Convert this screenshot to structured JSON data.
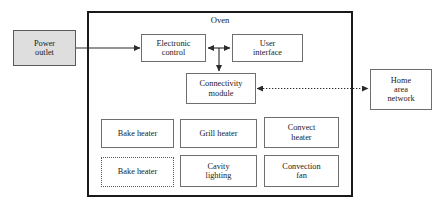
{
  "diagram": {
    "enclosure": {
      "label": "Oven"
    },
    "external_blocks": [
      {
        "id": "power-outlet",
        "label": "Power\noutlet",
        "style": "shaded"
      },
      {
        "id": "home-area-network",
        "label": "Home\narea\nnetwork",
        "style": "solid"
      }
    ],
    "internal_blocks": [
      {
        "id": "electronic-control",
        "label": "Electronic\ncontrol",
        "style": "solid"
      },
      {
        "id": "user-interface",
        "label": "User\ninterface",
        "style": "solid"
      },
      {
        "id": "connectivity-module",
        "label": "Connectivity\nmodule",
        "style": "solid"
      },
      {
        "id": "bake-heater-1",
        "label": "Bake heater",
        "style": "solid"
      },
      {
        "id": "grill-heater",
        "label": "Grill heater",
        "style": "solid"
      },
      {
        "id": "convect-heater",
        "label": "Convect\nheater",
        "style": "solid"
      },
      {
        "id": "bake-heater-2",
        "label": "Bake heater",
        "style": "dotted"
      },
      {
        "id": "cavity-lighting",
        "label": "Cavity\nlighting",
        "style": "solid"
      },
      {
        "id": "convection-fan",
        "label": "Convection\nfan",
        "style": "solid"
      }
    ],
    "connections": [
      {
        "id": "power-to-control",
        "from": "power-outlet",
        "to": "electronic-control",
        "line": "solid",
        "arrows": "single"
      },
      {
        "id": "control-to-interface",
        "from": "electronic-control",
        "to": "user-interface",
        "line": "solid",
        "arrows": "double"
      },
      {
        "id": "control-to-connectivity",
        "from": "electronic-control",
        "to": "connectivity-module",
        "line": "solid",
        "arrows": "single"
      },
      {
        "id": "connectivity-to-network",
        "from": "connectivity-module",
        "to": "home-area-network",
        "line": "dotted",
        "arrows": "double"
      }
    ],
    "colors": {
      "enclosure_border": "#1a1a1a",
      "box_border": "#6e6e6e",
      "shaded_fill": "#dedede",
      "line": "#2b2b2b",
      "text": "#1a1a1a"
    }
  }
}
